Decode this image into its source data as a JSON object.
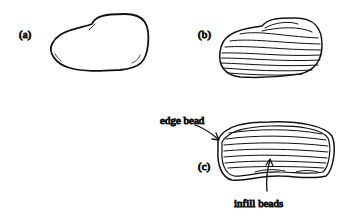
{
  "figure": {
    "panels": [
      {
        "label": "(a)",
        "description": "outline shape"
      },
      {
        "label": "(b)",
        "description": "contour layers"
      },
      {
        "label": "(c)",
        "description": "edge bead with infill"
      }
    ],
    "annotations": {
      "edge_bead": "edge bead",
      "infill_beads": "infill beads"
    }
  }
}
